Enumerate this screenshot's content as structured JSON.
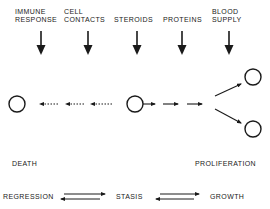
{
  "factors": [
    {
      "line1": "IMMUNE",
      "line2": "RESPONSE"
    },
    {
      "line1": "CELL",
      "line2": "CONTACTS"
    },
    {
      "line1": "",
      "line2": "STEROIDS"
    },
    {
      "line1": "",
      "line2": "PROTEINS"
    },
    {
      "line1": "BLOOD",
      "line2": "SUPPLY"
    }
  ],
  "outcomes": {
    "left": "DEATH",
    "right": "PROLIFERATION"
  },
  "states": {
    "left": "REGRESSION",
    "middle": "STASIS",
    "right": "GROWTH"
  },
  "colors": {
    "ink": "#1a1a1a",
    "background": "#ffffff"
  }
}
